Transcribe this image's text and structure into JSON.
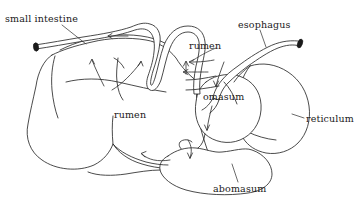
{
  "figure": {
    "background_color": "#ffffff",
    "line_color": "#2b2b2b",
    "text_color": "#1a1a1a"
  },
  "labels": {
    "small_intestine": "small intestine",
    "esophagus": "esophagus",
    "rumen_upper": "rumen",
    "omasum": "omasum",
    "rumen_body": "rumen",
    "reticulum": "reticulum",
    "abomasum": "abomasum"
  },
  "parts": [
    {
      "name": "small-intestine",
      "label": "small intestine",
      "icon": "tube-icon"
    },
    {
      "name": "esophagus",
      "label": "esophagus",
      "icon": "tube-icon"
    },
    {
      "name": "rumen",
      "label": "rumen",
      "icon": "organ-icon"
    },
    {
      "name": "omasum",
      "label": "omasum",
      "icon": "organ-icon"
    },
    {
      "name": "reticulum",
      "label": "reticulum",
      "icon": "organ-icon"
    },
    {
      "name": "abomasum",
      "label": "abomasum",
      "icon": "organ-icon"
    }
  ]
}
